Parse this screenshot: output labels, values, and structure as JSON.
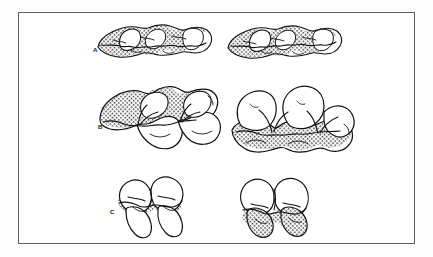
{
  "figure": {
    "kind": "scientific-plate",
    "caption_visible": false,
    "frame": {
      "border_color": "#5b5f63",
      "fill_color": "#ffffff",
      "x": 18,
      "y": 12,
      "width": 397,
      "height": 232
    },
    "background_color": "#fdfdfd",
    "ink_color": "#111111",
    "hatch_color": "#2b2b2b",
    "rows": [
      {
        "label": "A",
        "label_x": 93,
        "label_y": 51,
        "description": "elongate low-crowned molar row, occlusal view, heavily hatched",
        "specimens": [
          {
            "side": "left",
            "cx": 148,
            "cy": 42,
            "shaded": "full"
          },
          {
            "side": "right",
            "cx": 282,
            "cy": 42,
            "shaded": "full"
          }
        ]
      },
      {
        "label": "B",
        "label_x": 100,
        "label_y": 128,
        "description": "larger bilobed molar row, occlusal view; hatching on upper field at left and lower field at right",
        "specimens": [
          {
            "side": "left",
            "cx": 158,
            "cy": 118,
            "shaded": "upper"
          },
          {
            "side": "right",
            "cx": 292,
            "cy": 120,
            "shaded": "lower"
          }
        ]
      },
      {
        "label": "C",
        "label_x": 110,
        "label_y": 213,
        "description": "small two-lobed molar, occlusal view; hatching across mid-band at left and lower lobes at right",
        "specimens": [
          {
            "side": "left",
            "cx": 148,
            "cy": 205,
            "shaded": "middle"
          },
          {
            "side": "right",
            "cx": 272,
            "cy": 205,
            "shaded": "lower"
          }
        ]
      }
    ],
    "labels": {
      "a": "A",
      "b": "B",
      "c": "C"
    }
  }
}
